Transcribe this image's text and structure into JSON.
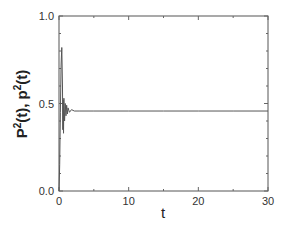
{
  "chart_data": {
    "type": "line",
    "title": "",
    "xlabel": "t",
    "ylabel": "P²(t), p²(t)",
    "ylabel_parts": {
      "a": "P",
      "sup1": "2",
      "b": "(t), p",
      "sup2": "2",
      "c": "(t)"
    },
    "xlim": [
      0,
      30
    ],
    "ylim": [
      0,
      1.0
    ],
    "xticks": [
      0,
      10,
      20,
      30
    ],
    "xtick_labels": [
      "0",
      "10",
      "20",
      "30"
    ],
    "yticks": [
      0.0,
      0.5,
      1.0
    ],
    "ytick_labels": [
      "0.0",
      "0.5",
      "1.0"
    ],
    "grid": false,
    "legend": null,
    "series": [
      {
        "name": "P²(t), p²(t)",
        "color": "#555555",
        "x": [
          0,
          0.1,
          0.2,
          0.3,
          0.4,
          0.5,
          0.55,
          0.6,
          0.65,
          0.7,
          0.8,
          0.9,
          1.0,
          1.1,
          1.2,
          1.3,
          1.5,
          1.8,
          2.2,
          3,
          5,
          10,
          15,
          20,
          25,
          30
        ],
        "y": [
          0.0,
          0.15,
          0.45,
          0.72,
          0.82,
          0.6,
          0.35,
          0.52,
          0.33,
          0.53,
          0.4,
          0.5,
          0.43,
          0.49,
          0.44,
          0.475,
          0.45,
          0.465,
          0.457,
          0.457,
          0.457,
          0.457,
          0.457,
          0.457,
          0.457,
          0.457
        ]
      }
    ],
    "annotations": []
  }
}
